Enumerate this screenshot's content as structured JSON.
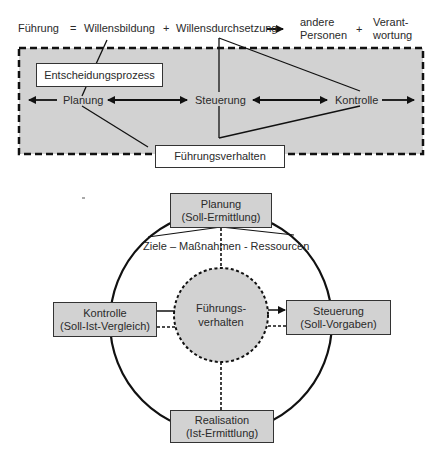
{
  "top_equation": {
    "fuehrung": "Führung",
    "equals": "=",
    "willensbildung": "Willensbildung",
    "plus1": "+",
    "willensdurchsetzung": "Willensdurchsetzung",
    "andere_personen_line1": "andere",
    "andere_personen_line2": "Personen",
    "plus2": "+",
    "verantwortung_line1": "Verant-",
    "verantwortung_line2": "wortung"
  },
  "process_panel": {
    "entscheidungsprozess": "Entscheidungsprozess",
    "planung": "Planung",
    "steuerung": "Steuerung",
    "kontrolle": "Kontrolle",
    "fuehrungsverhalten": "Führungsverhalten"
  },
  "cycle": {
    "planung_line1": "Planung",
    "planung_line2": "(Soll-Ermittlung)",
    "ziele": "Ziele – Maßnahmen - Ressourcen",
    "kontrolle_line1": "Kontrolle",
    "kontrolle_line2": "(Soll-Ist-Vergleich)",
    "center_line1": "Führungs-",
    "center_line2": "verhalten",
    "steuerung_line1": "Steuerung",
    "steuerung_line2": "(Soll-Vorgaben)",
    "realisation_line1": "Realisation",
    "realisation_line2": "(Ist-Ermittlung)"
  },
  "colors": {
    "panel_fill": "#d2d2d2",
    "box_fill": "#d2d2d2",
    "line": "#111111"
  }
}
